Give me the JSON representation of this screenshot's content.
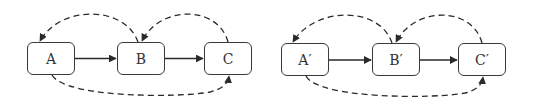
{
  "diagrams": [
    {
      "id": "left",
      "nodes": [
        {
          "label": "A",
          "x": 27,
          "y": 42,
          "w": 48,
          "h": 33
        },
        {
          "label": "B",
          "x": 117,
          "y": 42,
          "w": 48,
          "h": 33
        },
        {
          "label": "C",
          "x": 204,
          "y": 42,
          "w": 48,
          "h": 33
        }
      ],
      "solid_edges": [
        {
          "from": "A",
          "to": "B"
        },
        {
          "from": "B",
          "to": "C"
        }
      ],
      "dashed_edges": [
        {
          "from": "B",
          "to": "A",
          "route": "over-top"
        },
        {
          "from": "C",
          "to": "B",
          "route": "over-top"
        },
        {
          "from": "A",
          "to": "C",
          "route": "under-bottom"
        }
      ]
    },
    {
      "id": "right",
      "nodes": [
        {
          "label": "A′",
          "x": 281,
          "y": 43,
          "w": 48,
          "h": 33
        },
        {
          "label": "B′",
          "x": 372,
          "y": 43,
          "w": 48,
          "h": 33
        },
        {
          "label": "C′",
          "x": 458,
          "y": 43,
          "w": 48,
          "h": 33
        }
      ],
      "solid_edges": [
        {
          "from": "A′",
          "to": "B′"
        },
        {
          "from": "B′",
          "to": "C′"
        }
      ],
      "dashed_edges": [
        {
          "from": "B′",
          "to": "A′",
          "route": "over-top"
        },
        {
          "from": "C′",
          "to": "B′",
          "route": "over-top"
        },
        {
          "from": "A′",
          "to": "C′",
          "route": "under-bottom"
        }
      ]
    }
  ],
  "colors": {
    "stroke": "#2a2a2a",
    "text": "#333333",
    "background": "#ffffff"
  }
}
